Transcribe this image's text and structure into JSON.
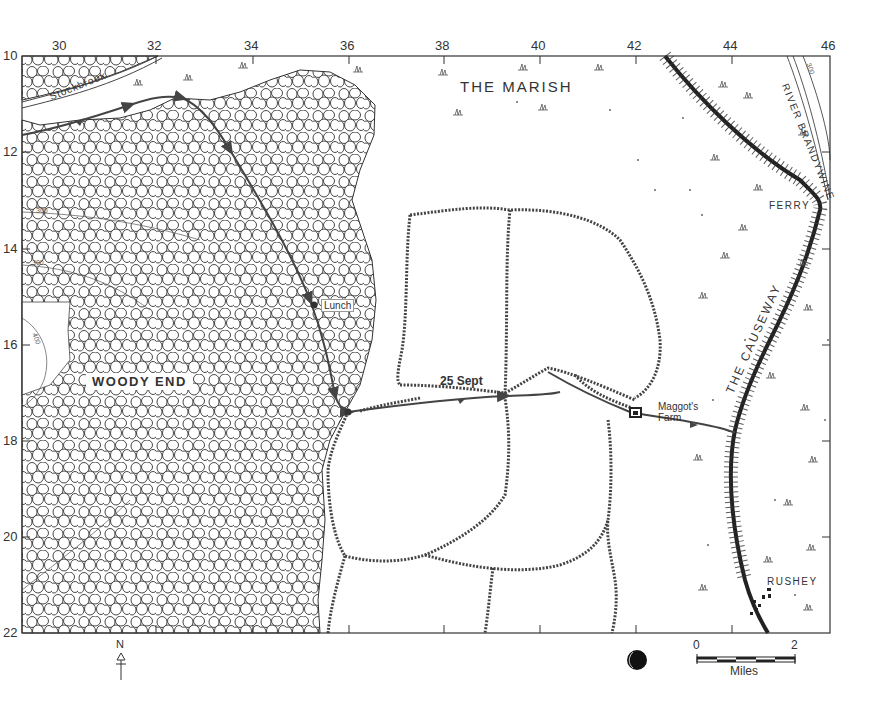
{
  "map": {
    "grid": {
      "x_labels": [
        "30",
        "32",
        "34",
        "36",
        "38",
        "40",
        "42",
        "44",
        "46"
      ],
      "y_labels": [
        "10",
        "12",
        "14",
        "16",
        "18",
        "20",
        "22"
      ]
    },
    "regions": {
      "woody_end": "WOODY END",
      "the_marish": "THE MARISH"
    },
    "features": {
      "stockbrook": "Stockbrook",
      "river": "RIVER BRANDYWINE",
      "causeway": "THE CAUSEWAY",
      "ferry": "FERRY",
      "rushey": "RUSHEY",
      "maggots_farm_line1": "Maggot's",
      "maggots_farm_line2": "Farm",
      "lunch": "Lunch",
      "date": "25 Sept"
    },
    "contours": {
      "c300_a": "300",
      "c300_b": "300",
      "c400": "400",
      "c300_river": "300"
    },
    "legend": {
      "north": "N",
      "scale_start": "0",
      "scale_end": "2",
      "scale_unit": "Miles",
      "moon_phase": "moon-icon"
    },
    "colors": {
      "ink": "#222222",
      "route": "#444444",
      "paper": "#ffffff"
    }
  }
}
